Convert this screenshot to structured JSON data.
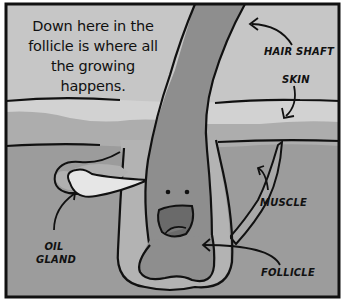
{
  "caption": {
    "line1": "Down here in the",
    "line2": "follicle is where all",
    "line3": "the growing happens."
  },
  "labels": {
    "hair_shaft": "HAIR SHAFT",
    "skin": "SKIN",
    "muscle": "MUSCLE",
    "oil_gland_1": "OIL",
    "oil_gland_2": "GLAND",
    "follicle": "FOLLICLE"
  },
  "colors": {
    "sky": "#c8c8c8",
    "skin_top": "#d4d4d4",
    "skin_band": "#acacac",
    "dermis": "#9a9a9a",
    "hair": "#8c8c8c",
    "follicle_outer": "#b4b4b4",
    "oil_gland": "#e6e6e6",
    "muscle": "#a6a6a6",
    "mouth": "#6a6a6a",
    "ink": "#111111"
  }
}
